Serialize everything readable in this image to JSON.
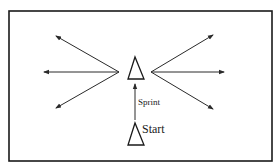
{
  "diagram": {
    "type": "drill-layout",
    "border": {
      "x": 9,
      "y": 11,
      "width": 263,
      "height": 150,
      "color": "#1a1a1a"
    },
    "colors": {
      "stroke": "#2a2a2a",
      "background": "#ffffff"
    },
    "cones": [
      {
        "id": "center-cone",
        "apex": [
          135,
          57
        ],
        "base_left": [
          128,
          79
        ],
        "base_right": [
          144,
          79
        ]
      },
      {
        "id": "start-cone",
        "apex": [
          135,
          123
        ],
        "base_left": [
          128,
          145
        ],
        "base_right": [
          144,
          145
        ]
      }
    ],
    "labels": {
      "sprint": "Sprint",
      "start": "Start"
    },
    "sprint_arrow": {
      "from": [
        135,
        120
      ],
      "to": [
        135,
        84
      ]
    },
    "left_arrows": [
      {
        "from": [
          119,
          72
        ],
        "to": [
          56,
          36
        ]
      },
      {
        "from": [
          119,
          72
        ],
        "to": [
          44,
          72
        ]
      },
      {
        "from": [
          119,
          72
        ],
        "to": [
          56,
          108
        ]
      }
    ],
    "right_arrows": [
      {
        "from": [
          151,
          72
        ],
        "to": [
          213,
          35
        ]
      },
      {
        "from": [
          151,
          72
        ],
        "to": [
          224,
          72
        ]
      },
      {
        "from": [
          151,
          72
        ],
        "to": [
          213,
          109
        ]
      }
    ]
  }
}
